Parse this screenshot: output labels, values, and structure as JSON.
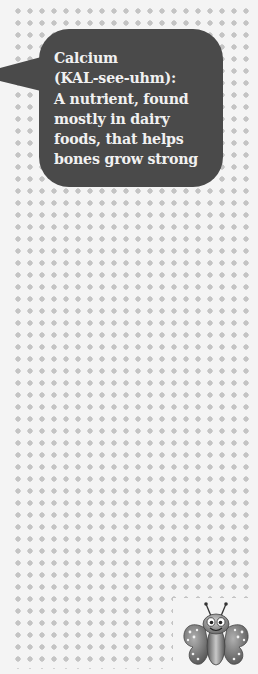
{
  "definition": {
    "term": "Calcium",
    "pronunciation": "(KAL-see-uhm):",
    "text": "Calcium\n(KAL-see-uhm):\nA nutrient, found\nmostly in dairy\nfoods, that helps\nbones grow strong"
  },
  "colors": {
    "background": "#f4f4f4",
    "dots": "#c4c4c4",
    "bubble": "#4a4a4a",
    "bubble_text": "#f1f1f1"
  },
  "mascot": {
    "icon": "butterfly-icon"
  }
}
